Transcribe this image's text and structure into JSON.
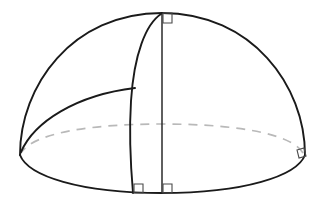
{
  "figure": {
    "title": "Hemisphere with vertical radius, curved meridian and inclined great-circle arc",
    "kind": "geometry-diagram",
    "subject": "hemisphere",
    "background_color": "#ffffff",
    "canvas": {
      "width": 323,
      "height": 210
    }
  },
  "colors": {
    "outline": "#1a1a1a",
    "hidden_edge": "#b9b9b9",
    "inner_edge": "#2a2a2a",
    "angle_marker": "#4a4a4a",
    "background": "#ffffff"
  },
  "geometry": {
    "apex": {
      "x": 162,
      "y": 13
    },
    "base_center": {
      "x": 162,
      "y": 160
    },
    "base_bottom": {
      "x": 162,
      "y": 193
    },
    "left_rim": {
      "x": 20,
      "y": 155
    },
    "right_rim": {
      "x": 305,
      "y": 155
    },
    "meridian_foot": {
      "x": 133,
      "y": 193
    },
    "meridian_junction": {
      "x": 135,
      "y": 88
    },
    "base_semi_major_axis": 142,
    "base_semi_minor_axis": 36,
    "dome_height": 147
  },
  "elements": {
    "dome_outline": {
      "label": "Hemisphere silhouette arc",
      "description": "Solid outline arc sweeping from the left rim over the apex to the right rim",
      "style": "solid"
    },
    "base_front": {
      "label": "Base ellipse front arc",
      "description": "Solid lower half of the base ellipse, visible near edge",
      "style": "solid"
    },
    "base_back": {
      "label": "Base ellipse back arc",
      "description": "Dashed upper half of the base ellipse, hidden far edge",
      "style": "dashed"
    },
    "vertical_axis": {
      "label": "Vertical radius",
      "description": "Straight segment from apex down to the centre of the base",
      "style": "solid"
    },
    "meridian_arc": {
      "label": "Curved meridian",
      "description": "Arc running from the apex down and to the left to the base rim",
      "style": "solid"
    },
    "inclined_arc": {
      "label": "Inclined great-circle arc",
      "description": "Arc from the left rim rising to meet the curved meridian",
      "style": "solid"
    }
  },
  "angle_markers": [
    {
      "id": "apex-right-angle",
      "label": "Right angle at apex",
      "at": {
        "x": 162,
        "y": 13
      },
      "size": 9,
      "symbol": "right-angle"
    },
    {
      "id": "base-left-right-angle",
      "label": "Right angle at meridian foot",
      "at": {
        "x": 133,
        "y": 193
      },
      "size": 9,
      "symbol": "right-angle"
    },
    {
      "id": "base-center-right-angle",
      "label": "Right angle at base centre",
      "at": {
        "x": 162,
        "y": 193
      },
      "size": 9,
      "symbol": "right-angle"
    },
    {
      "id": "rim-right-angle",
      "label": "Right angle at right rim",
      "at": {
        "x": 303,
        "y": 154
      },
      "size": 8,
      "symbol": "right-angle"
    }
  ],
  "labels": {
    "text_labels": [],
    "note": "No text labels are rendered in this figure"
  }
}
